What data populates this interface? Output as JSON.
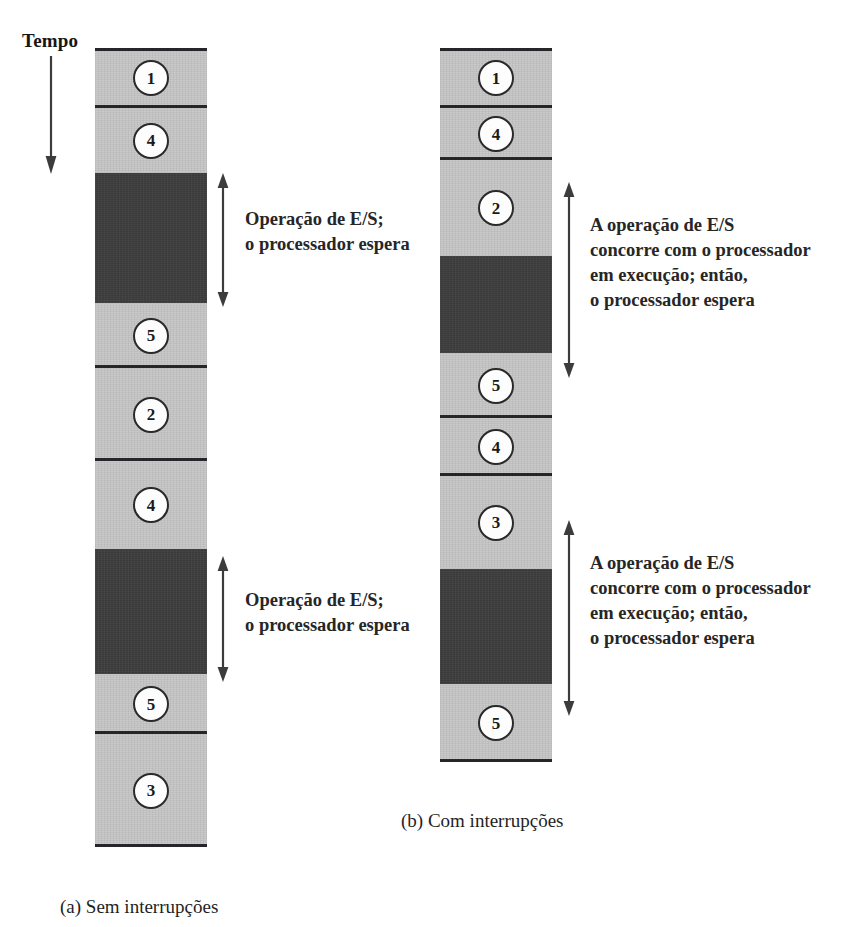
{
  "figure": {
    "time_axis_label": "Tempo",
    "time_axis_direction": "down"
  },
  "panels": [
    {
      "id": "a",
      "caption": "(a) Sem interrupções",
      "caption_x": 60,
      "caption_y": 896,
      "column": {
        "x": 95,
        "y": 48,
        "width": 112
      },
      "segments": [
        {
          "kind": "light",
          "label": "1",
          "height": 60,
          "rule_top": true,
          "rule_bottom": true
        },
        {
          "kind": "light",
          "label": "4",
          "height": 65,
          "rule_top": false,
          "rule_bottom": false
        },
        {
          "kind": "dark",
          "label": "",
          "height": 130,
          "rule_top": false,
          "rule_bottom": false
        },
        {
          "kind": "light",
          "label": "5",
          "height": 65,
          "rule_top": false,
          "rule_bottom": true
        },
        {
          "kind": "light",
          "label": "2",
          "height": 93,
          "rule_top": false,
          "rule_bottom": true
        },
        {
          "kind": "light",
          "label": "4",
          "height": 88,
          "rule_top": false,
          "rule_bottom": false
        },
        {
          "kind": "dark",
          "label": "",
          "height": 125,
          "rule_top": false,
          "rule_bottom": false
        },
        {
          "kind": "light",
          "label": "5",
          "height": 60,
          "rule_top": false,
          "rule_bottom": true
        },
        {
          "kind": "light",
          "label": "3",
          "height": 113,
          "rule_top": false,
          "rule_bottom": true
        }
      ],
      "annotations": [
        {
          "name": "io-wait-1",
          "text": "Operação de E/S;\no processador espera",
          "arrow_x": 216,
          "arrow_y": 173,
          "arrow_height": 134,
          "text_x": 245,
          "text_y": 207
        },
        {
          "name": "io-wait-2",
          "text": "Operação de E/S;\no processador espera",
          "arrow_x": 216,
          "arrow_y": 556,
          "arrow_height": 126,
          "text_x": 245,
          "text_y": 588
        }
      ]
    },
    {
      "id": "b",
      "caption": "(b) Com interrupções",
      "caption_x": 401,
      "caption_y": 810,
      "column": {
        "x": 440,
        "y": 48,
        "width": 112
      },
      "segments": [
        {
          "kind": "light",
          "label": "1",
          "height": 60,
          "rule_top": true,
          "rule_bottom": true
        },
        {
          "kind": "light",
          "label": "4",
          "height": 52,
          "rule_top": false,
          "rule_bottom": true
        },
        {
          "kind": "light",
          "label": "2",
          "height": 96,
          "rule_top": false,
          "rule_bottom": false
        },
        {
          "kind": "dark",
          "label": "",
          "height": 97,
          "rule_top": false,
          "rule_bottom": false
        },
        {
          "kind": "light",
          "label": "5",
          "height": 65,
          "rule_top": false,
          "rule_bottom": true
        },
        {
          "kind": "light",
          "label": "4",
          "height": 58,
          "rule_top": false,
          "rule_bottom": true
        },
        {
          "kind": "light",
          "label": "3",
          "height": 93,
          "rule_top": false,
          "rule_bottom": false
        },
        {
          "kind": "dark",
          "label": "",
          "height": 115,
          "rule_top": false,
          "rule_bottom": false
        },
        {
          "kind": "light",
          "label": "5",
          "height": 78,
          "rule_top": false,
          "rule_bottom": true
        }
      ],
      "annotations": [
        {
          "name": "io-concurrent-1",
          "text": "A operação de E/S\nconcorre com o processador\nem execução; então,\no processador espera",
          "arrow_x": 562,
          "arrow_y": 182,
          "arrow_height": 196,
          "text_x": 590,
          "text_y": 213
        },
        {
          "name": "io-concurrent-2",
          "text": "A operação de E/S\nconcorre com o processador\nem execução; então,\no processador espera",
          "arrow_x": 562,
          "arrow_y": 520,
          "arrow_height": 196,
          "text_x": 590,
          "text_y": 551
        }
      ]
    }
  ],
  "colors": {
    "segment_light": "#c9c9c9",
    "segment_dark": "#3a3a3a",
    "rule": "#25252a",
    "bubble_fill": "#fdfdfd",
    "bubble_stroke": "#2a2a2a",
    "text": "#1f1f1f",
    "arrow": "#3c3c3c"
  }
}
